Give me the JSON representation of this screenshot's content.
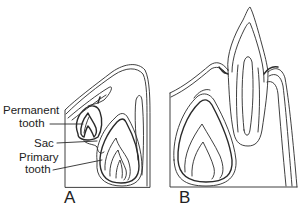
{
  "figure": {
    "panels": [
      {
        "id": "A",
        "label": "A"
      },
      {
        "id": "B",
        "label": "B"
      }
    ],
    "annotations": [
      {
        "line1": "Permanent",
        "line2": "tooth"
      },
      {
        "line1": "Sac"
      },
      {
        "line1": "Primary",
        "line2": "tooth"
      }
    ],
    "colors": {
      "line": "#2a2a2a",
      "background": "#ffffff"
    }
  }
}
